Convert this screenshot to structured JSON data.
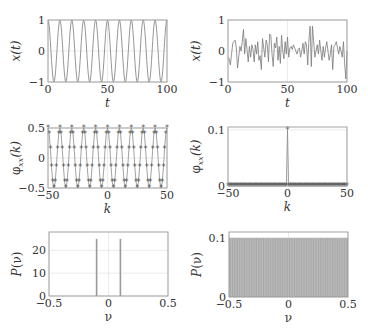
{
  "chart_data": [
    {
      "id": "top-left",
      "type": "line",
      "title": "",
      "xlabel": "t",
      "ylabel": "x(t)",
      "xlim": [
        0,
        100
      ],
      "ylim": [
        -1,
        1
      ],
      "xticks": [
        0,
        50,
        100
      ],
      "yticks": [
        -1,
        0,
        1
      ],
      "xtick_labels": [
        "0",
        "50",
        "100"
      ],
      "ytick_labels": [
        "−1",
        "0",
        "1"
      ],
      "grid": true,
      "description": "cosine signal x(t)=cos(2*pi*0.1*t), period 10, 10 cycles over 0..100",
      "series": [
        {
          "name": "x(t)",
          "function": "cos(2*pi*0.1*t)",
          "t_step": 1
        }
      ],
      "box": {
        "x0": 48,
        "y0": 20,
        "x1": 167,
        "y1": 82
      }
    },
    {
      "id": "top-right",
      "type": "line",
      "title": "",
      "xlabel": "t",
      "ylabel": "x(t)",
      "xlim": [
        0,
        100
      ],
      "ylim": [
        -1,
        1
      ],
      "xticks": [
        0,
        50,
        100
      ],
      "yticks": [
        -1,
        0,
        1
      ],
      "xtick_labels": [
        "0",
        "50",
        "100"
      ],
      "ytick_labels": [
        "−1",
        "0",
        "1"
      ],
      "grid": true,
      "description": "white noise signal, values roughly in [-0.9, 0.85]",
      "series": [
        {
          "name": "x(t)",
          "values": [
            -0.2,
            -0.25,
            -0.45,
            -0.1,
            0.25,
            0.3,
            0.35,
            0.1,
            -0.55,
            -0.2,
            0.15,
            0.0,
            0.3,
            0.7,
            -0.1,
            0.4,
            0.05,
            -0.35,
            0.15,
            -0.2,
            0.2,
            0.05,
            -0.35,
            0.2,
            -0.1,
            0.3,
            -0.3,
            -0.15,
            -0.6,
            0.4,
            0.1,
            -0.2,
            0.35,
            0.2,
            -0.35,
            0.55,
            0.5,
            -0.1,
            -0.5,
            0.25,
            0.1,
            0.45,
            -0.3,
            0.15,
            -0.4,
            0.5,
            0.0,
            -0.25,
            0.3,
            -0.1,
            0.45,
            -0.2,
            0.1,
            0.15,
            0.05,
            0.2,
            0.1,
            0.0,
            -0.1,
            0.05,
            0.1,
            -0.2,
            0.0,
            0.25,
            -0.1,
            0.3,
            0.2,
            -0.45,
            0.35,
            0.8,
            -0.5,
            0.8,
            0.3,
            -0.2,
            0.0,
            0.2,
            -0.1,
            0.35,
            0.0,
            -0.3,
            0.15,
            -0.2,
            0.1,
            0.3,
            0.0,
            -0.3,
            -0.1,
            0.2,
            -0.6,
            0.15,
            0.2,
            0.3,
            0.1,
            -0.1,
            0.15,
            0.0,
            -0.2,
            0.3,
            -0.4,
            -0.9,
            0.0
          ]
        }
      ],
      "box": {
        "x0": 228,
        "y0": 20,
        "x1": 347,
        "y1": 82
      }
    },
    {
      "id": "middle-left",
      "type": "line",
      "title": "",
      "xlabel": "k",
      "ylabel": "φxx(k)",
      "xlim": [
        -50,
        50
      ],
      "ylim": [
        -0.5,
        0.5
      ],
      "xticks": [
        -50,
        0,
        50
      ],
      "yticks": [
        -0.5,
        0,
        0.5
      ],
      "xtick_labels": [
        "−50",
        "0",
        "50"
      ],
      "ytick_labels": [
        "−0.5",
        "0",
        "0.5"
      ],
      "grid": true,
      "markers": "*",
      "description": "autocorrelation of cosine: phi(k)=0.5*cos(2*pi*0.1*k), k=-50..50, star markers",
      "series": [
        {
          "name": "phi_xx(k)",
          "function": "0.5*cos(2*pi*0.1*k)",
          "k_step": 1
        }
      ],
      "box": {
        "x0": 48,
        "y0": 128,
        "x1": 167,
        "y1": 188
      }
    },
    {
      "id": "middle-right",
      "type": "line",
      "title": "",
      "xlabel": "k",
      "ylabel": "φxx(k)",
      "xlim": [
        -50,
        50
      ],
      "ylim": [
        0,
        0.105
      ],
      "xticks": [
        -50,
        0,
        50
      ],
      "yticks": [
        0,
        0.1
      ],
      "xtick_labels": [
        "−50",
        "0",
        "50"
      ],
      "ytick_labels": [
        "0",
        "0.1"
      ],
      "grid": true,
      "markers": "*",
      "description": "autocorrelation of white noise: 0.1 at k=0, ~0 elsewhere",
      "series": [
        {
          "name": "phi_xx(k)",
          "peak_k": 0,
          "peak_value": 0.1,
          "other_value": 0
        }
      ],
      "box": {
        "x0": 228,
        "y0": 127,
        "x1": 347,
        "y1": 186
      }
    },
    {
      "id": "bottom-left",
      "type": "bar",
      "title": "",
      "xlabel": "ν",
      "ylabel": "P(ν)",
      "xlim": [
        -0.5,
        0.5
      ],
      "ylim": [
        0,
        28
      ],
      "xticks": [
        -0.5,
        0,
        0.5
      ],
      "yticks": [
        0,
        10,
        20
      ],
      "xtick_labels": [
        "−0.5",
        "0",
        "0.5"
      ],
      "ytick_labels": [
        "0",
        "10",
        "20"
      ],
      "grid": true,
      "description": "power spectrum of cosine: two spikes at nu=-0.1 and nu=0.1",
      "x": [
        -0.1,
        0.1
      ],
      "values": [
        25,
        25
      ],
      "box": {
        "x0": 49,
        "y0": 232,
        "x1": 168,
        "y1": 296
      }
    },
    {
      "id": "bottom-right",
      "type": "bar",
      "title": "",
      "xlabel": "ν",
      "ylabel": "P(ν)",
      "xlim": [
        -0.5,
        0.5
      ],
      "ylim": [
        0,
        0.11
      ],
      "xticks": [
        -0.5,
        0,
        0.5
      ],
      "yticks": [
        0,
        0.1
      ],
      "xtick_labels": [
        "−0.5",
        "0",
        "0.5"
      ],
      "ytick_labels": [
        "0",
        "0.1"
      ],
      "grid": true,
      "description": "power spectrum of white noise: flat at 0.1 across all frequencies",
      "flat_value": 0.1,
      "box": {
        "x0": 229,
        "y0": 232,
        "x1": 348,
        "y1": 297
      }
    }
  ],
  "colors": {
    "axis": "#9a9a9a",
    "grid": "#e6e6e6",
    "line": "#8a8a8a",
    "marker": "#555555",
    "fill": "#b8b8b8",
    "text": "#333333"
  }
}
